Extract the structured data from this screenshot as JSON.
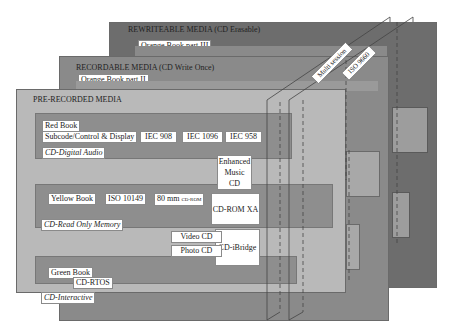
{
  "colors": {
    "rewriteable_panel": "#6d6d6d",
    "recordable_panel": "#8a8a8a",
    "prerecorded_panel": "#b9b9b9",
    "band_dark": "#8e8e8e",
    "label_bg": "#ffffff"
  },
  "layers": {
    "rewriteable": {
      "title": "REWRITEABLE MEDIA (CD Erasable)",
      "book": "Orange Book part III"
    },
    "recordable": {
      "title": "RECORDABLE MEDIA (CD Write Once)",
      "book": "Orange Book part II"
    },
    "prerecorded": {
      "title": "PRE-RECORDED MEDIA",
      "red_band": {
        "book": "Red Book",
        "spec": "Subcode/Control & Display",
        "standards": [
          "IEC 908",
          "IEC 1096",
          "IEC 958"
        ],
        "format": "CD-Digital Audio"
      },
      "yellow_band": {
        "book": "Yellow Book",
        "standard": "ISO 10149",
        "size_main": "80 mm",
        "size_sub": "CD-ROM",
        "format": "CD-Read Only Memory"
      },
      "green_band": {
        "book": "Green Book",
        "os": "CD-RTOS",
        "format": "CD-Interactive"
      }
    }
  },
  "bridge_formats": {
    "enhanced_music_cd_line1": "Enhanced",
    "enhanced_music_cd_line2": "Music CD",
    "cd_rom_xa": "CD-ROM XA",
    "cd_ibridge": "CD-iBridge",
    "video_cd": "Video CD",
    "photo_cd": "Photo CD"
  },
  "planes": {
    "multi_session": "Multi session",
    "iso_9660": "ISO 9660"
  }
}
